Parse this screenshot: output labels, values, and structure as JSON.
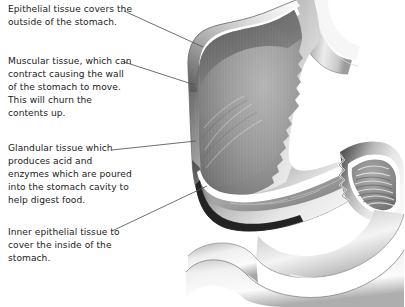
{
  "diagram": {
    "subject": "stomach",
    "style": "grayscale medical illustration, cutaway view",
    "background_color": "#ffffff",
    "text_color": "#1b1b1b",
    "leader_line_color": "#555555",
    "palette": {
      "outer_wall_dark": "#4f4f4f",
      "outer_wall_mid": "#8e8e8e",
      "muscular_light": "#d9d9d9",
      "epithelium_highlight": "#ffffff",
      "cavity_dark": "#6f6f6f",
      "cavity_mid": "#9a9a9a",
      "cavity_light": "#c2c2c2",
      "outline": "#2b2b2b",
      "duodenum_light": "#f2f2f2",
      "duodenum_shadow": "#9d9d9d"
    },
    "callouts": [
      {
        "id": "epithelial-outer",
        "text": "Epithelial tissue covers the outside of the stomach.",
        "leader": {
          "x1": 124,
          "y1": 11,
          "x2": 203,
          "y2": 47
        }
      },
      {
        "id": "muscular",
        "text": "Muscular tissue, which can contract causing the wall of the stomach to move. This will churn the contents up.",
        "leader": {
          "x1": 124,
          "y1": 62,
          "x2": 195,
          "y2": 85
        }
      },
      {
        "id": "glandular",
        "text": "Glandular tissue which produces acid and enzymes which are poured into the stomach cavity to help digest food.",
        "leader": {
          "x1": 112,
          "y1": 150,
          "x2": 196,
          "y2": 141
        }
      },
      {
        "id": "epithelial-inner",
        "text": "Inner epithelial tissue to cover the inside of the stomach.",
        "leader": {
          "x1": 112,
          "y1": 231,
          "x2": 207,
          "y2": 186
        }
      }
    ],
    "anatomy_parts": [
      {
        "name": "esophagus",
        "label_visible": false
      },
      {
        "name": "fundus",
        "label_visible": false
      },
      {
        "name": "body",
        "label_visible": false
      },
      {
        "name": "lesser-curvature",
        "label_visible": false
      },
      {
        "name": "greater-curvature",
        "label_visible": false
      },
      {
        "name": "pyloric-antrum",
        "label_visible": false
      },
      {
        "name": "pylorus",
        "label_visible": false
      },
      {
        "name": "duodenum",
        "label_visible": false
      },
      {
        "name": "rugae-folds",
        "label_visible": false
      }
    ]
  }
}
